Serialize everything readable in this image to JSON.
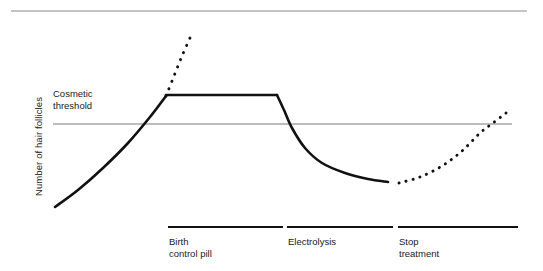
{
  "figure": {
    "background": "#ffffff",
    "ink_color": "#111111",
    "rule_color": "#8a8a8a",
    "top_rule": {
      "x1": 11,
      "x2": 527,
      "y": 11
    }
  },
  "chart_data": {
    "type": "line",
    "title": "",
    "subtitle": "",
    "xlabel": "",
    "ylabel": "Number of hair follicles",
    "grid": false,
    "legend_position": "none",
    "xlim": [
      0,
      543
    ],
    "ylim_note": "y axis is qualitative (no numeric ticks)",
    "x_tick_labels": [],
    "y_tick_labels": [],
    "annotations": [
      {
        "name": "cosmetic-threshold",
        "text": "Cosmetic\nthreshold",
        "line1": "Cosmetic",
        "line2": "threshold",
        "rule_y": 124,
        "rule_x1": 53,
        "rule_x2": 512
      }
    ],
    "phases": [
      {
        "id": "birth-control-pill",
        "label_line1": "Birth",
        "label_line2": "control pill",
        "bar_x1": 168,
        "bar_x2": 283,
        "bar_y": 227
      },
      {
        "id": "electrolysis",
        "label_line1": "Electrolysis",
        "label_line2": "",
        "bar_x1": 287,
        "bar_x2": 393,
        "bar_y": 227
      },
      {
        "id": "stop-treatment",
        "label_line1": "Stop",
        "label_line2": "treatment",
        "bar_x1": 398,
        "bar_x2": 518,
        "bar_y": 227
      }
    ],
    "series": [
      {
        "name": "untreated-rise",
        "style": "solid",
        "description": "Number of hair follicles rising steeply before treatment, crossing the cosmetic threshold",
        "points": [
          [
            55,
            207
          ],
          [
            78,
            190
          ],
          [
            103,
            168
          ],
          [
            128,
            143
          ],
          [
            150,
            117
          ],
          [
            166,
            96
          ]
        ]
      },
      {
        "name": "no-treatment-projection",
        "style": "dotted",
        "description": "Projected continued rise if no treatment is given",
        "points": [
          [
            166,
            96
          ],
          [
            174,
            76
          ],
          [
            182,
            56
          ],
          [
            190,
            38
          ]
        ]
      },
      {
        "name": "on-birth-control-pill",
        "style": "solid",
        "description": "Follicle count held constant at plateau while on the birth control pill",
        "points": [
          [
            166,
            95
          ],
          [
            210,
            95
          ],
          [
            250,
            95
          ],
          [
            277,
            95
          ]
        ]
      },
      {
        "name": "electrolysis-decline",
        "style": "solid",
        "description": "Follicle count falls rapidly with electrolysis, back below the cosmetic threshold, then levels off",
        "points": [
          [
            277,
            95
          ],
          [
            284,
            110
          ],
          [
            292,
            128
          ],
          [
            305,
            148
          ],
          [
            322,
            163
          ],
          [
            345,
            173
          ],
          [
            368,
            179
          ],
          [
            388,
            182
          ]
        ]
      },
      {
        "name": "relapse-after-stopping",
        "style": "dotted",
        "description": "Follicle count climbs again after treatment stops, re-crossing the cosmetic threshold",
        "points": [
          [
            399,
            183
          ],
          [
            420,
            177
          ],
          [
            442,
            166
          ],
          [
            462,
            151
          ],
          [
            480,
            133
          ],
          [
            493,
            123
          ],
          [
            506,
            113
          ]
        ]
      }
    ]
  }
}
